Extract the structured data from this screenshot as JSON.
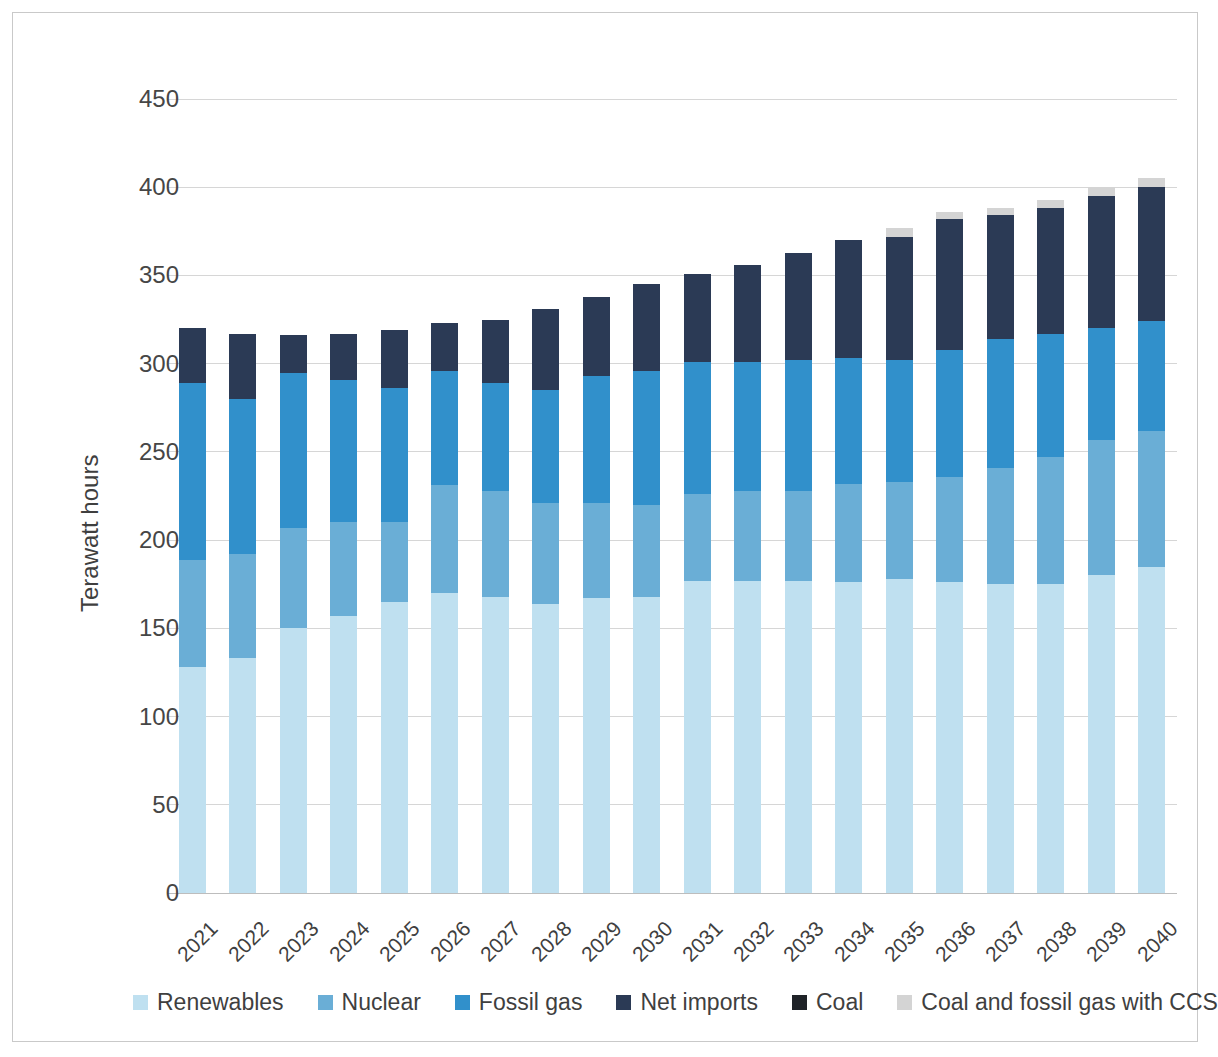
{
  "chart_data": {
    "type": "bar",
    "stacked": true,
    "title": "",
    "xlabel": "",
    "ylabel": "Terawatt hours",
    "ylim": [
      0,
      450
    ],
    "yticks": [
      0,
      50,
      100,
      150,
      200,
      250,
      300,
      350,
      400,
      450
    ],
    "ytick_labels": [
      "0",
      "50",
      "100",
      "150",
      "200",
      "250",
      "300",
      "350",
      "400",
      "450"
    ],
    "grid": true,
    "legend_position": "bottom",
    "categories": [
      "2021",
      "2022",
      "2023",
      "2024",
      "2025",
      "2026",
      "2027",
      "2028",
      "2029",
      "2030",
      "2031",
      "2032",
      "2033",
      "2034",
      "2035",
      "2036",
      "2037",
      "2038",
      "2039",
      "2040"
    ],
    "series": [
      {
        "name": "Renewables",
        "color": "#bfe0f0",
        "values": [
          128,
          133,
          150,
          157,
          165,
          170,
          168,
          164,
          167,
          168,
          177,
          177,
          177,
          176,
          178,
          176,
          175,
          175,
          180,
          185
        ]
      },
      {
        "name": "Nuclear",
        "color": "#6aaed6",
        "values": [
          61,
          59,
          57,
          53,
          45,
          61,
          60,
          57,
          54,
          52,
          49,
          51,
          51,
          56,
          55,
          60,
          66,
          72,
          77,
          77
        ]
      },
      {
        "name": "Fossil gas",
        "color": "#3190cb",
        "values": [
          100,
          88,
          88,
          81,
          76,
          65,
          61,
          64,
          72,
          76,
          75,
          73,
          74,
          71,
          69,
          72,
          73,
          70,
          63,
          62
        ]
      },
      {
        "name": "Net imports",
        "color": "#2b3a55",
        "values": [
          31,
          37,
          21,
          26,
          33,
          27,
          36,
          46,
          45,
          49,
          50,
          55,
          61,
          67,
          70,
          74,
          70,
          71,
          75,
          76
        ]
      },
      {
        "name": "Coal",
        "color": "#1f2328",
        "values": [
          0,
          0,
          0,
          0,
          0,
          0,
          0,
          0,
          0,
          0,
          0,
          0,
          0,
          0,
          0,
          0,
          0,
          0,
          0,
          0
        ]
      },
      {
        "name": "Coal and fossil gas with CCS",
        "color": "#d4d4d4",
        "values": [
          0,
          0,
          0,
          0,
          0,
          0,
          0,
          0,
          0,
          0,
          0,
          0,
          0,
          0,
          5,
          4,
          4,
          5,
          5,
          5
        ]
      }
    ],
    "totals": [
      320,
      317,
      316,
      317,
      319,
      323,
      325,
      331,
      338,
      345,
      351,
      356,
      363,
      370,
      377,
      386,
      388,
      393,
      400,
      405
    ]
  },
  "axis": {
    "ylabel_text": "Terawatt hours"
  },
  "legend": {
    "items": [
      {
        "label": "Renewables",
        "color": "#bfe0f0"
      },
      {
        "label": "Nuclear",
        "color": "#6aaed6"
      },
      {
        "label": "Fossil gas",
        "color": "#3190cb"
      },
      {
        "label": "Net imports",
        "color": "#2b3a55"
      },
      {
        "label": "Coal",
        "color": "#1f2328"
      },
      {
        "label": "Coal and fossil gas with CCS",
        "color": "#d4d4d4"
      }
    ]
  }
}
